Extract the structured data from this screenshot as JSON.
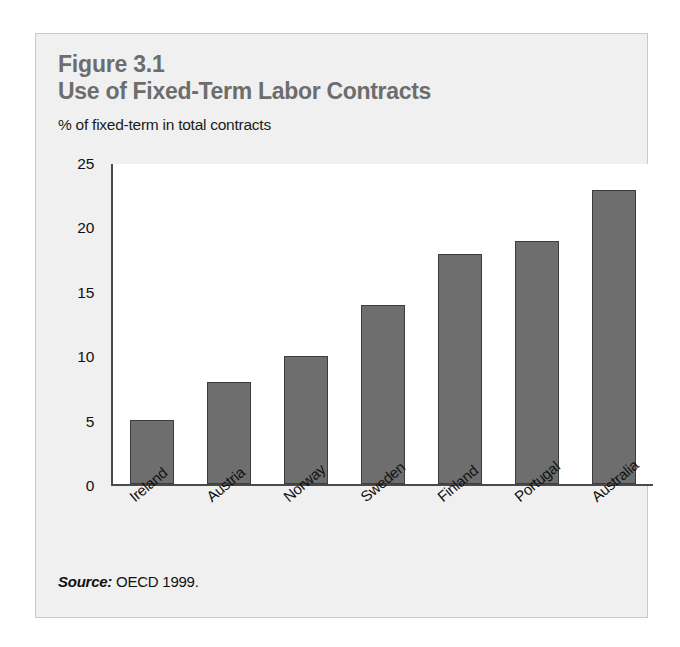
{
  "figure": {
    "number": "Figure 3.1",
    "title": "Use of Fixed-Term Labor Contracts",
    "subtitle": "% of fixed-term in total contracts",
    "source_label": "Source:",
    "source_text": "OECD 1999."
  },
  "colors": {
    "panel_background": "#f0f0f0",
    "plot_background": "#ffffff",
    "bar_fill": "#6e6e6e",
    "bar_stroke": "#3d3d3d",
    "title_text": "#6d6d6d",
    "body_text": "#111111",
    "axis_line": "#4a4a4a",
    "panel_border": "#c9c9c9"
  },
  "chart_data": {
    "type": "bar",
    "title": "Use of Fixed-Term Labor Contracts",
    "subtitle": "% of fixed-term in total contracts",
    "xlabel": "",
    "ylabel": "% of fixed-term in total contracts",
    "categories": [
      "Ireland",
      "Austria",
      "Norway",
      "Sweden",
      "Finland",
      "Portugal",
      "Australia"
    ],
    "values": [
      5,
      8,
      10,
      14,
      18,
      19,
      23
    ],
    "yticks": [
      0,
      5,
      10,
      15,
      20,
      25
    ],
    "ylim": [
      0,
      25
    ],
    "grid": false,
    "legend": false,
    "source": "OECD 1999."
  }
}
